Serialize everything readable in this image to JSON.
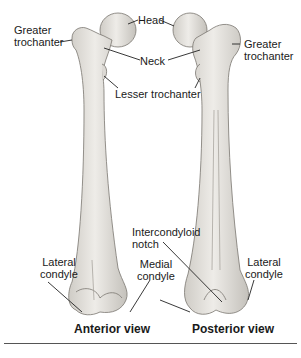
{
  "figure": {
    "colors": {
      "bone_fill": "#e8e6e2",
      "bone_shade": "#c9c6c0",
      "bone_outline": "#7a7670",
      "leader": "#222222",
      "text": "#1a1a1a",
      "rule": "#555555"
    },
    "anterior": {
      "caption": "Anterior view",
      "labels": {
        "greater_trochanter_1": "Greater",
        "greater_trochanter_2": "trochanter",
        "head": "Head",
        "neck": "Neck",
        "lesser_trochanter": "Lesser trochanter",
        "lateral_condyle_1": "Lateral",
        "lateral_condyle_2": "condyle",
        "medial_condyle_1": "Medial",
        "medial_condyle_2": "condyle"
      }
    },
    "posterior": {
      "caption": "Posterior view",
      "labels": {
        "greater_trochanter_1": "Greater",
        "greater_trochanter_2": "trochanter",
        "intercondyloid_notch_1": "Intercondyloid",
        "intercondyloid_notch_2": "notch",
        "lateral_condyle_1": "Lateral",
        "lateral_condyle_2": "condyle"
      }
    }
  }
}
